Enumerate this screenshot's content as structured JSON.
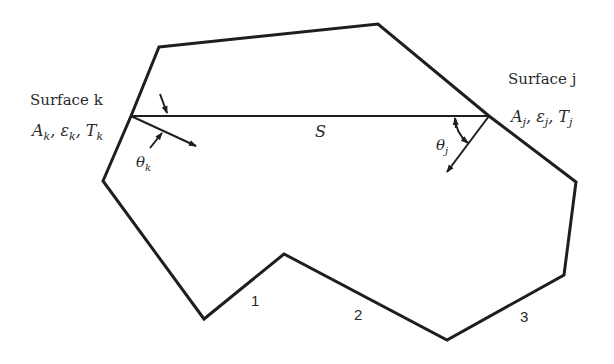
{
  "diagram": {
    "type": "radiation-enclosure",
    "colors": {
      "stroke": "#1e1e1e",
      "background": "#ffffff",
      "text": "#2a2a2a"
    },
    "enclosure_vertices": [
      [
        159,
        47
      ],
      [
        378,
        24
      ],
      [
        489,
        116
      ],
      [
        576,
        182
      ],
      [
        564,
        275
      ],
      [
        447,
        340
      ],
      [
        284,
        254
      ],
      [
        204,
        319
      ],
      [
        103,
        181
      ],
      [
        131,
        116
      ]
    ],
    "surface_k": {
      "title": "Surface k",
      "props_A": "A",
      "props_eps": "ε",
      "props_T": "T",
      "sub": "k",
      "angle_symbol": "θ",
      "angle_sub": "k"
    },
    "surface_j": {
      "title": "Surface j",
      "props_A": "A",
      "props_eps": "ε",
      "props_T": "T",
      "sub": "j",
      "angle_symbol": "θ",
      "angle_sub": "j"
    },
    "path_label": "S",
    "wall_labels": [
      "1",
      "2",
      "3"
    ]
  }
}
